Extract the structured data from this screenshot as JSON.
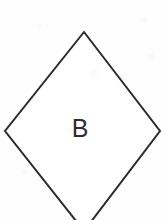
{
  "canvas": {
    "width": 165,
    "height": 220,
    "background_color": "#fefefe"
  },
  "diagram": {
    "shape_type": "diamond",
    "label": "B",
    "stroke_color": "#2b2b2b",
    "stroke_width": 2,
    "fill_color": "#ffffff",
    "vertices": {
      "top": {
        "x": 84,
        "y": 32
      },
      "right": {
        "x": 160,
        "y": 131
      },
      "bottom": {
        "x": 84,
        "y": 231
      },
      "left": {
        "x": 5,
        "y": 131
      }
    },
    "polygon_points": "84,32 160,131 84,231 5,131",
    "clipped_edges": [
      "bottom"
    ],
    "label_position": {
      "x": 80,
      "y": 128
    },
    "label_font_size": 25
  }
}
